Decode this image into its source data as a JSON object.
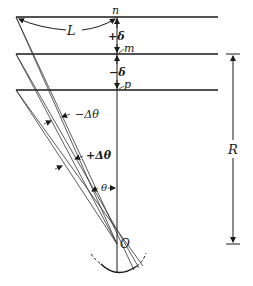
{
  "diagram": {
    "labels": {
      "L": "L",
      "n": "n",
      "m": "m",
      "p": "p",
      "plus_delta": "+δ",
      "minus_delta": "−δ",
      "minus_dtheta": "−Δθ",
      "plus_dtheta": "+Δθ",
      "theta": "θ",
      "O": "O",
      "R": "R"
    },
    "planes": [
      {
        "name": "n",
        "y": 17
      },
      {
        "name": "m",
        "y": 54
      },
      {
        "name": "p",
        "y": 90
      }
    ],
    "origin": {
      "x": 117,
      "y": 244
    },
    "colors": {
      "ink": "#1a1a1a",
      "background": "#ffffff"
    }
  }
}
